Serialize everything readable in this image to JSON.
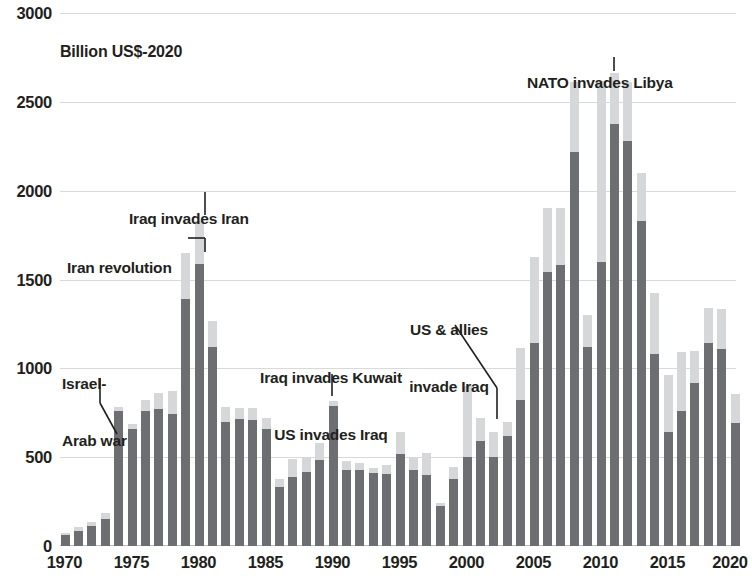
{
  "chart_data": {
    "type": "bar",
    "title": "",
    "subtitle": "",
    "unit_label": "Billion US$-2020",
    "xlabel": "",
    "ylabel": "",
    "ylim": [
      0,
      3000
    ],
    "ytick_values": [
      0,
      500,
      1000,
      1500,
      2000,
      2500,
      3000
    ],
    "ytick_labels": [
      "0",
      "500",
      "1000",
      "1500",
      "2000",
      "2500",
      "3000"
    ],
    "xtick_values": [
      1970,
      1975,
      1980,
      1985,
      1990,
      1995,
      2000,
      2005,
      2010,
      2015,
      2020
    ],
    "xtick_labels": [
      "1970",
      "1975",
      "1980",
      "1985",
      "1990",
      "1995",
      "2000",
      "2005",
      "2010",
      "2015",
      "2020"
    ],
    "grid": true,
    "legend_position": "none",
    "stacked": true,
    "colors": {
      "lower_segment": "#6d6e71",
      "upper_segment": "#d6d7d8",
      "gridline": "#d9d9d9",
      "text": "#231f20",
      "background": "#ffffff"
    },
    "series": [
      {
        "name": "lower",
        "color": "#6d6e71",
        "values": [
          60,
          85,
          110,
          150,
          760,
          660,
          760,
          770,
          745,
          1390,
          1590,
          1120,
          700,
          715,
          710,
          660,
          330,
          390,
          415,
          485,
          790,
          430,
          430,
          410,
          405,
          520,
          430,
          400,
          225,
          380,
          500,
          590,
          500,
          620,
          820,
          1140,
          1540,
          1580,
          2220,
          1120,
          1600,
          2375,
          2280,
          1830,
          1080,
          640,
          760,
          920,
          1140,
          1110,
          695
        ]
      },
      {
        "name": "upper",
        "color": "#d6d7d8",
        "values": [
          15,
          20,
          25,
          35,
          25,
          25,
          60,
          90,
          130,
          260,
          240,
          145,
          80,
          60,
          65,
          60,
          50,
          100,
          85,
          95,
          25,
          50,
          40,
          30,
          50,
          120,
          70,
          125,
          15,
          65,
          400,
          130,
          140,
          80,
          295,
          485,
          360,
          320,
          390,
          180,
          1015,
          290,
          330,
          270,
          345,
          325,
          330,
          180,
          200,
          225,
          160
        ]
      }
    ],
    "x": [
      1970,
      1971,
      1972,
      1973,
      1974,
      1975,
      1976,
      1977,
      1978,
      1979,
      1980,
      1981,
      1982,
      1983,
      1984,
      1985,
      1986,
      1987,
      1988,
      1989,
      1990,
      1991,
      1992,
      1993,
      1994,
      1995,
      1996,
      1997,
      1998,
      1999,
      2000,
      2001,
      2002,
      2003,
      2004,
      2005,
      2006,
      2007,
      2008,
      2009,
      2010,
      2011,
      2012,
      2013,
      2014,
      2015,
      2016,
      2017,
      2018,
      2019,
      2020
    ],
    "totals": [
      75,
      105,
      135,
      185,
      785,
      685,
      820,
      860,
      875,
      1650,
      1830,
      1265,
      780,
      775,
      775,
      720,
      380,
      490,
      500,
      580,
      815,
      480,
      470,
      440,
      455,
      640,
      500,
      525,
      240,
      445,
      900,
      720,
      640,
      700,
      1115,
      1625,
      1900,
      1900,
      2610,
      1300,
      2615,
      2665,
      2610,
      2100,
      1425,
      965,
      1090,
      1100,
      1340,
      1335,
      855
    ],
    "annotations": [
      {
        "id": "israel-arab-war",
        "text_lines": [
          "Israel-",
          "Arab war"
        ],
        "target_year": 1974,
        "target_value": 640
      },
      {
        "id": "iran-revolution",
        "text_lines": [
          "Iran revolution"
        ],
        "target_year": 1979,
        "target_value": 1670
      },
      {
        "id": "iraq-invades-iran",
        "text_lines": [
          "Iraq invades Iran"
        ],
        "target_year": 1980,
        "target_value": 1845
      },
      {
        "id": "iraq-invades-kuwait",
        "text_lines": [
          "Iraq invades Kuwait",
          "US invades Iraq"
        ],
        "target_year": 1990,
        "target_value": 830
      },
      {
        "id": "us-allies-invade-iraq",
        "text_lines": [
          "US & allies",
          "invade Iraq"
        ],
        "target_year": 2003,
        "target_value": 715
      },
      {
        "id": "nato-invades-libya",
        "text_lines": [
          "NATO invades Libya"
        ],
        "target_year": 2011,
        "target_value": 2680
      }
    ]
  }
}
